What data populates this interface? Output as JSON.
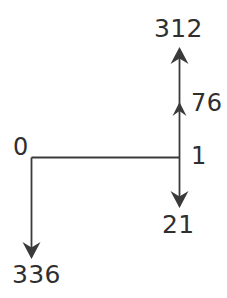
{
  "diagram": {
    "type": "flow-arrow-diagram",
    "background_color": "#ffffff",
    "stroke_color": "#3a3a3a",
    "text_color": "#2f2f2f",
    "nodes": [
      {
        "id": "top",
        "label": "312",
        "position": "top-right"
      },
      {
        "id": "mid",
        "label": "76",
        "position": "middle-right"
      },
      {
        "id": "junction",
        "label": "1",
        "position": "center-right"
      },
      {
        "id": "origin",
        "label": "0",
        "position": "center-left"
      },
      {
        "id": "down_right",
        "label": "21",
        "position": "bottom-right"
      },
      {
        "id": "down_left",
        "label": "336",
        "position": "bottom-left"
      }
    ],
    "edges": [
      {
        "from": "junction",
        "to": "mid",
        "direction": "up",
        "arrowhead": "small"
      },
      {
        "from": "mid",
        "to": "top",
        "direction": "up",
        "arrowhead": "large"
      },
      {
        "from": "junction",
        "to": "origin",
        "direction": "left",
        "arrowhead": "none"
      },
      {
        "from": "junction",
        "to": "down_right",
        "direction": "down",
        "arrowhead": "large"
      },
      {
        "from": "origin",
        "to": "down_left",
        "direction": "down",
        "arrowhead": "large"
      }
    ]
  }
}
